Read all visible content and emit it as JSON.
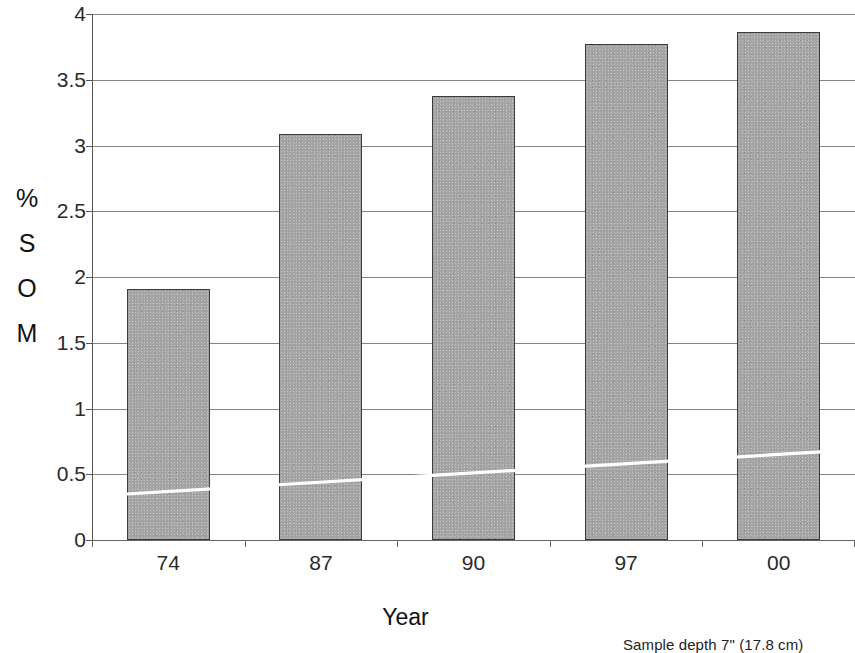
{
  "chart_data": {
    "type": "bar",
    "title": "",
    "subtitle": "",
    "categories": [
      "74",
      "87",
      "90",
      "97",
      "00"
    ],
    "values": [
      1.91,
      3.09,
      3.38,
      3.77,
      3.86
    ],
    "series": [
      {
        "name": "% SOM",
        "values": [
          1.91,
          3.09,
          3.38,
          3.77,
          3.86
        ]
      }
    ],
    "trendline": {
      "name": "trend",
      "color": "#ffffff",
      "x_start": "74",
      "x_end": "00",
      "y_start": 0.35,
      "y_end": 0.67
    },
    "xlabel": "Year",
    "ylabel": "% SOM",
    "ylabel_stacked": [
      "%",
      "S",
      "O",
      "M"
    ],
    "ylim": [
      0,
      4
    ],
    "ytick_labels": [
      "0",
      "0.5",
      "1",
      "1.5",
      "2",
      "2.5",
      "3",
      "3.5",
      "4"
    ],
    "ytick_values": [
      0,
      0.5,
      1,
      1.5,
      2,
      2.5,
      3,
      3.5,
      4
    ],
    "grid": true,
    "grid_axis": "y",
    "legend": false,
    "bar_fill_color": "#a3a3a3",
    "bar_edge_color": "#3b3b3b",
    "grid_color": "#6e6e6e",
    "background_color": "#ffffff"
  },
  "footnote": {
    "text": "Sample depth  7\" (17.8 cm)"
  },
  "axis": {
    "x_title": "Year",
    "y_title_chars": [
      "%",
      "S",
      "O",
      "M"
    ]
  }
}
